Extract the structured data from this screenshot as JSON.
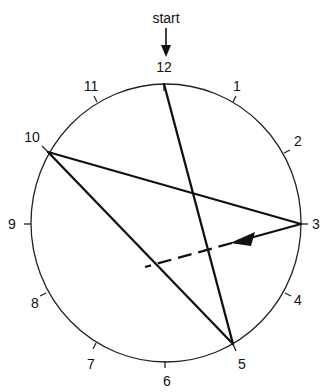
{
  "diagram": {
    "start_label": "start",
    "numbers": [
      {
        "text": "12",
        "x": 164,
        "y": 72
      },
      {
        "text": "1",
        "x": 237,
        "y": 91
      },
      {
        "text": "2",
        "x": 298,
        "y": 146
      },
      {
        "text": "3",
        "x": 316,
        "y": 229
      },
      {
        "text": "4",
        "x": 298,
        "y": 305
      },
      {
        "text": "5",
        "x": 242,
        "y": 369
      },
      {
        "text": "6",
        "x": 167,
        "y": 386
      },
      {
        "text": "7",
        "x": 91,
        "y": 369
      },
      {
        "text": "8",
        "x": 35,
        "y": 308
      },
      {
        "text": "9",
        "x": 12,
        "y": 229
      },
      {
        "text": "10",
        "x": 32,
        "y": 142
      },
      {
        "text": "11",
        "x": 91,
        "y": 91
      }
    ],
    "colors": {
      "line": "#111111",
      "background": "#ffffff"
    }
  }
}
